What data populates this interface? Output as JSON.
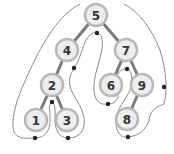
{
  "diagram": {
    "type": "binary-search-tree-traversal-contour",
    "colors": {
      "edge": "#7a7a7a",
      "node_fill": "#eeeeee",
      "node_ring": "#b9b9b9",
      "contour": "#8a8a8a",
      "dot": "#222222",
      "label": "#333333"
    },
    "nodes": [
      {
        "id": "n5",
        "label": "5",
        "x": 96,
        "y": 15
      },
      {
        "id": "n4",
        "label": "4",
        "x": 67,
        "y": 50
      },
      {
        "id": "n7",
        "label": "7",
        "x": 126,
        "y": 50
      },
      {
        "id": "n2",
        "label": "2",
        "x": 52,
        "y": 85
      },
      {
        "id": "n6",
        "label": "6",
        "x": 111,
        "y": 85
      },
      {
        "id": "n9",
        "label": "9",
        "x": 142,
        "y": 85
      },
      {
        "id": "n1",
        "label": "1",
        "x": 36,
        "y": 120
      },
      {
        "id": "n3",
        "label": "3",
        "x": 67,
        "y": 120
      },
      {
        "id": "n8",
        "label": "8",
        "x": 127,
        "y": 119
      }
    ],
    "edges": [
      [
        "n5",
        "n4"
      ],
      [
        "n5",
        "n7"
      ],
      [
        "n4",
        "n2"
      ],
      [
        "n2",
        "n1"
      ],
      [
        "n2",
        "n3"
      ],
      [
        "n7",
        "n6"
      ],
      [
        "n7",
        "n9"
      ],
      [
        "n9",
        "n8"
      ]
    ]
  }
}
